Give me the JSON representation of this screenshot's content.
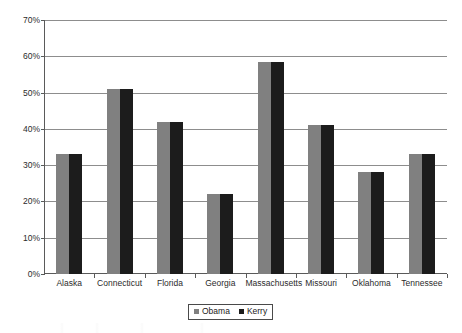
{
  "chart_data": {
    "type": "bar",
    "title": "",
    "subtitle": "",
    "xlabel": "",
    "ylabel": "",
    "categories": [
      "Alaska",
      "Connecticut",
      "Florida",
      "Georgia",
      "Massachusetts",
      "Missouri",
      "Oklahoma",
      "Tennessee"
    ],
    "series": [
      {
        "name": "Obama",
        "color": "#808080",
        "values": [
          33,
          51,
          42,
          22,
          58.5,
          41,
          28,
          33
        ]
      },
      {
        "name": "Kerry",
        "color": "#1c1c1c",
        "values": [
          33,
          51,
          42,
          22,
          58.5,
          41,
          28,
          33
        ]
      }
    ],
    "ylim": [
      0,
      70
    ],
    "ytick_values": [
      0,
      10,
      20,
      30,
      40,
      50,
      60,
      70
    ],
    "ytick_labels": [
      "0%",
      "10%",
      "20%",
      "30%",
      "40%",
      "50%",
      "60%",
      "70%"
    ],
    "grid": true,
    "grid_axis": "y",
    "legend_position": "bottom-center",
    "value_unit": "%"
  },
  "legend": {
    "entries": [
      {
        "label": "Obama"
      },
      {
        "label": "Kerry"
      }
    ]
  }
}
